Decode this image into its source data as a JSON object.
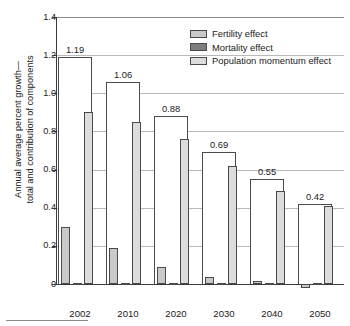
{
  "chart_data": {
    "type": "bar",
    "title": "",
    "xlabel": "",
    "ylabel": "Annual average percent growth—total and contribution of components",
    "ylabel_line1": "Annual average percent growth—",
    "ylabel_line2": "total and contribution of components",
    "ylim": [
      0,
      1.4
    ],
    "ytick_values": [
      0,
      0.2,
      0.4,
      0.6,
      0.8,
      1.0,
      1.2,
      1.4
    ],
    "ytick_labels": [
      "0",
      "0.2",
      "0.4",
      "0.6",
      "0.8",
      "1.0",
      "1.2",
      "1.4"
    ],
    "grid": true,
    "legend_position": "upper right",
    "categories": [
      "2002",
      "2010",
      "2020",
      "2030",
      "2040",
      "2050"
    ],
    "series": [
      {
        "name": "Total",
        "key": "total",
        "kind": "outline",
        "show_labels": true,
        "values": [
          1.19,
          1.06,
          0.88,
          0.69,
          0.55,
          0.42
        ],
        "labels": [
          "1.19",
          "1.06",
          "0.88",
          "0.69",
          "0.55",
          "0.42"
        ]
      },
      {
        "name": "Fertility effect",
        "key": "fertility",
        "color": "#c9c9c9",
        "values": [
          0.3,
          0.19,
          0.09,
          0.035,
          0.015,
          -0.02
        ]
      },
      {
        "name": "Mortality effect",
        "key": "mortality",
        "color": "#7d7d7d",
        "values": [
          0.0,
          0.0,
          0.0,
          0.0,
          0.0,
          0.0
        ]
      },
      {
        "name": "Population momentum effect",
        "key": "momentum",
        "color": "#dcdcdc",
        "values": [
          0.9,
          0.85,
          0.76,
          0.62,
          0.49,
          0.41
        ]
      }
    ]
  },
  "legend": {
    "items": [
      {
        "label": "Fertility effect",
        "color": "#c9c9c9"
      },
      {
        "label": "Mortality effect",
        "color": "#7d7d7d"
      },
      {
        "label": "Population momentum effect",
        "color": "#dcdcdc"
      }
    ]
  },
  "axes": {
    "y_title_line1": "Annual average percent growth—",
    "y_title_line2": "total and contribution of components"
  }
}
